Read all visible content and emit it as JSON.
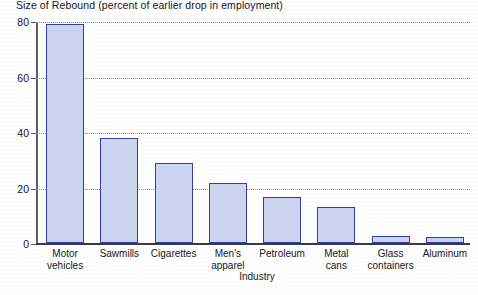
{
  "chart_data": {
    "type": "bar",
    "title": "Size of Rebound (percent of earlier drop in employment)",
    "xlabel": "Industry",
    "ylabel": "",
    "ylim": [
      0,
      80
    ],
    "yticks": [
      0,
      20,
      40,
      60,
      80
    ],
    "ytick_labels": [
      "0",
      "20",
      "40",
      "60",
      "80"
    ],
    "grid": true,
    "legend": false,
    "categories": [
      "Motor\nvehicles",
      "Sawmills",
      "Cigarettes",
      "Men's\napparel",
      "Petroleum",
      "Metal\ncans",
      "Glass\ncontainers",
      "Aluminum"
    ],
    "values": [
      79,
      38,
      29,
      21.5,
      16.5,
      13,
      2.5,
      2
    ],
    "series": [
      {
        "name": "Size of Rebound",
        "values": [
          79,
          38,
          29,
          21.5,
          16.5,
          13,
          2.5,
          2
        ]
      }
    ],
    "colors": {
      "bar_fill": "#ccd4f0",
      "bar_border": "#2f3fa8",
      "gridline": "#8d8d95",
      "axis": "#3a3a40",
      "text": "#15151c",
      "background": "#ffffff"
    }
  }
}
